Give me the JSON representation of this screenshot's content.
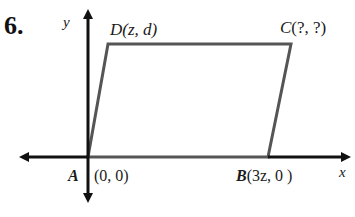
{
  "problem": {
    "number": "6."
  },
  "axes": {
    "x_label": "x",
    "y_label": "y"
  },
  "points": {
    "A": {
      "name": "A",
      "coords": "(0, 0)"
    },
    "B": {
      "name": "B",
      "coords": "(3z, 0 )"
    },
    "C": {
      "name": "C",
      "coords": "(?, ?)"
    },
    "D": {
      "name": "D",
      "coords": "(z, d)"
    }
  },
  "colors": {
    "axis": "#111111",
    "shape": "#555555"
  }
}
